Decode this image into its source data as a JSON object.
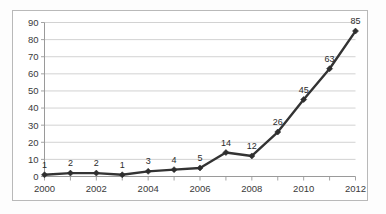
{
  "chart_data": {
    "type": "line",
    "title": "",
    "subtitle": "",
    "xlabel": "",
    "ylabel": "",
    "categories": [
      2000,
      2001,
      2002,
      2003,
      2004,
      2005,
      2006,
      2007,
      2008,
      2009,
      2010,
      2011,
      2012
    ],
    "values": [
      1,
      2,
      2,
      1,
      3,
      4,
      5,
      14,
      12,
      26,
      45,
      63,
      85
    ],
    "point_labels": [
      "1",
      "2",
      "2",
      "1",
      "3",
      "4",
      "5",
      "14",
      "12",
      "26",
      "45",
      "63",
      "85"
    ],
    "xlim": [
      2000,
      2012
    ],
    "ylim": [
      0,
      90
    ],
    "y_ticks": [
      0,
      10,
      20,
      30,
      40,
      50,
      60,
      70,
      80,
      90
    ],
    "y_tick_labels": [
      "0",
      "10",
      "20",
      "30",
      "40",
      "50",
      "60",
      "70",
      "80",
      "90"
    ],
    "x_ticks": [
      2000,
      2001,
      2002,
      2003,
      2004,
      2005,
      2006,
      2007,
      2008,
      2009,
      2010,
      2011,
      2012
    ],
    "x_tick_labels": [
      "2000",
      "",
      "2002",
      "",
      "2004",
      "",
      "2006",
      "",
      "2008",
      "",
      "2010",
      "",
      "2012"
    ],
    "x_labeled_ticks": [
      "2000",
      "2002",
      "2004",
      "2006",
      "2008",
      "2010",
      "2012"
    ],
    "grid": true,
    "grid_axis": "y",
    "legend": false,
    "legend_position": "none",
    "marker": "diamond",
    "series": [
      {
        "name": "",
        "values": [
          1,
          2,
          2,
          1,
          3,
          4,
          5,
          14,
          12,
          26,
          45,
          63,
          85
        ]
      }
    ],
    "colors": {
      "line": "#333333",
      "marker": "#2e2e2e",
      "gridline": "#c6c6c6",
      "axis": "#9a9a9a",
      "text": "#3a3a3a",
      "background": "#ffffff",
      "frame": "#b9b9b9"
    }
  }
}
